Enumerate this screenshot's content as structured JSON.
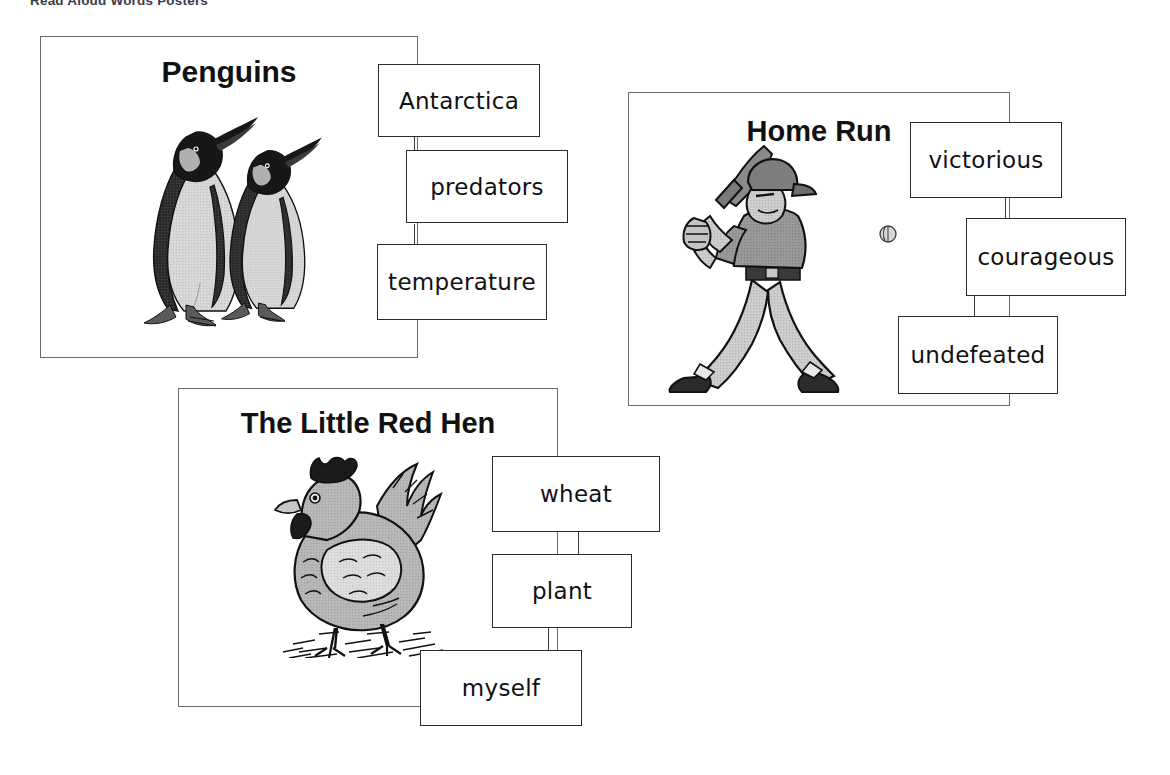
{
  "page": {
    "heading": "Read Aloud Words Posters",
    "background_color": "#ffffff",
    "frame_color": "#6b6b6b",
    "card_border_color": "#2b2b2b",
    "text_color": "#111111"
  },
  "posters": [
    {
      "id": "penguins",
      "title": "Penguins",
      "artwork": "penguins-illustration",
      "words": [
        "Antarctica",
        "predators",
        "temperature"
      ]
    },
    {
      "id": "home-run",
      "title": "Home Run",
      "artwork": "baseball-batter-illustration",
      "words": [
        "victorious",
        "courageous",
        "undefeated"
      ]
    },
    {
      "id": "little-red-hen",
      "title": "The Little Red Hen",
      "artwork": "hen-illustration",
      "words": [
        "wheat",
        "plant",
        "myself"
      ]
    }
  ]
}
